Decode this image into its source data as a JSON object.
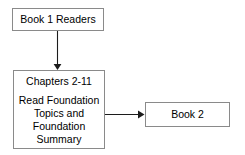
{
  "diagram": {
    "background_color": "#ffffff",
    "border_color": "#8a8a8a",
    "text_color": "#000000",
    "arrow_color": "#1c1c1c",
    "nodes": [
      {
        "id": "book1-readers",
        "label": "Book 1 Readers"
      },
      {
        "id": "chapters",
        "title": "Chapters 2-11",
        "body_lines": [
          "Read Foundation",
          "Topics and",
          "Foundation",
          "Summary"
        ]
      },
      {
        "id": "book2",
        "label": "Book 2"
      }
    ],
    "connectors": [
      {
        "id": "book1-to-chapters",
        "direction": "down",
        "from": "book1-readers",
        "to": "chapters"
      },
      {
        "id": "chapters-to-book2",
        "direction": "right",
        "from": "chapters",
        "to": "book2"
      }
    ]
  }
}
